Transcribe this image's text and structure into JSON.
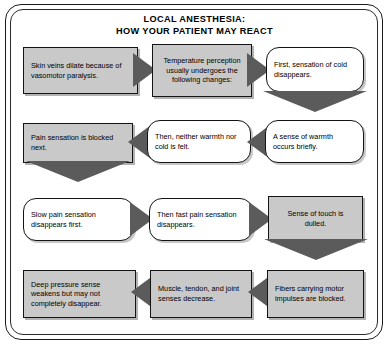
{
  "diagram": {
    "title_line1": "LOCAL ANESTHESIA:",
    "title_line2": "HOW YOUR PATIENT MAY REACT",
    "colors": {
      "box_fill_grey": "#c9c9c9",
      "box_fill_white": "#ffffff",
      "box_border": "#141414",
      "arrow_fill": "#5b5b5b",
      "frame_border": "#1a1a1a",
      "text": "#000000",
      "background": "#ffffff"
    },
    "flow_type": "serpentine-flowchart",
    "rows": [
      {
        "index": 1,
        "direction": "left-to-right",
        "nodes": [
          {
            "id": "n1",
            "shape": "rectangle",
            "fill": "grey",
            "text": "Skin veins dilate because of vasomotor paralysis."
          },
          {
            "id": "n2",
            "shape": "rectangle",
            "fill": "grey",
            "text": "Temperature perception usually undergoes the following changes:"
          },
          {
            "id": "n3",
            "shape": "rounded",
            "fill": "white",
            "text": "First, sensation of cold disappears."
          }
        ],
        "connectors": [
          "arrow-right",
          "arrow-right"
        ]
      },
      {
        "index": 2,
        "direction": "right-to-left",
        "nodes": [
          {
            "id": "n6",
            "shape": "rectangle",
            "fill": "grey",
            "text": "Pain sensation is blocked next."
          },
          {
            "id": "n5",
            "shape": "rounded",
            "fill": "white",
            "text": "Then, neither warmth nor cold is felt."
          },
          {
            "id": "n4",
            "shape": "rounded",
            "fill": "white",
            "text": "A sense of warmth occurs briefly."
          }
        ],
        "connectors": [
          "arrow-left",
          "arrow-left"
        ]
      },
      {
        "index": 3,
        "direction": "left-to-right",
        "nodes": [
          {
            "id": "n7",
            "shape": "rounded",
            "fill": "white",
            "text": "Slow pain sensation disappears first."
          },
          {
            "id": "n8",
            "shape": "rounded",
            "fill": "white",
            "text": "Then fast pain sensation disappears."
          },
          {
            "id": "n9",
            "shape": "rectangle",
            "fill": "grey",
            "text": "Sense of touch is dulled."
          }
        ],
        "connectors": [
          "arrow-right",
          "arrow-right"
        ]
      },
      {
        "index": 4,
        "direction": "right-to-left",
        "nodes": [
          {
            "id": "n12",
            "shape": "rectangle",
            "fill": "grey",
            "text": "Deep pressure sense weakens but may not completely disappear."
          },
          {
            "id": "n11",
            "shape": "rectangle",
            "fill": "grey",
            "text": "Muscle, tendon, and joint senses decrease."
          },
          {
            "id": "n10",
            "shape": "rectangle",
            "fill": "grey",
            "text": "Fibers carrying motor impulses are blocked."
          }
        ],
        "connectors": [
          "arrow-left",
          "arrow-left"
        ]
      }
    ],
    "row_connectors": [
      {
        "from_row": 1,
        "to_row": 2,
        "side": "right",
        "icon": "arrow-down-icon"
      },
      {
        "from_row": 2,
        "to_row": 3,
        "side": "left",
        "icon": "arrow-down-icon"
      },
      {
        "from_row": 3,
        "to_row": 4,
        "side": "right",
        "icon": "arrow-down-icon"
      }
    ]
  }
}
